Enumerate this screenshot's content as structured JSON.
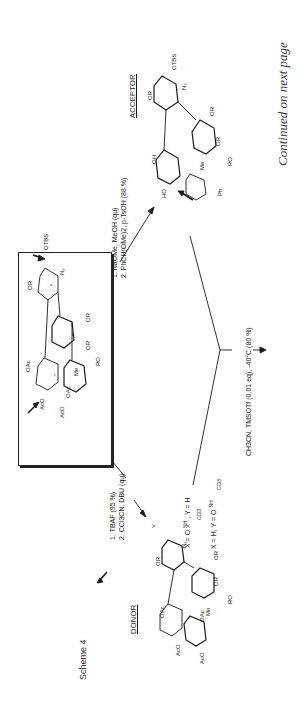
{
  "page": {
    "scheme_title": "Scheme 4",
    "continued_note": "Continued on next page"
  },
  "starting_material": {
    "substituents": [
      "OTBS",
      "N3",
      "OR",
      "OAc",
      "AcO",
      "AcO",
      "OAc",
      "Me",
      "OR",
      "OR",
      "RO"
    ],
    "ring_labels": [
      "a",
      "b",
      "c"
    ]
  },
  "acceptor": {
    "label": "ACCEPTOR",
    "substituents": [
      "OTBS",
      "N3",
      "OR",
      "OR",
      "OR",
      "RO",
      "OH",
      "HO",
      "Me",
      "Ph"
    ]
  },
  "donor": {
    "label": "DONOR",
    "substituents": [
      "Y",
      "X",
      "N3",
      "OR",
      "OAc",
      "AcO",
      "AcO",
      "OAc",
      "Me",
      "OR",
      "OR",
      "RO"
    ],
    "definitions": [
      {
        "x": "X = O–C(=NH)CCl3",
        "y": "Y = H"
      },
      {
        "x": "X = H",
        "y": "Y = O–C(=NH)CCl3"
      }
    ],
    "def1_text": "X = O",
    "def1_tail": ", Y = H",
    "def2_text": "X = H, Y = O",
    "nh": "NH",
    "ccl3": "CCl3"
  },
  "reactions": {
    "to_acceptor": {
      "step1": "1.  NaOMe, MeOH (qu)",
      "step2": "2.  PhCH(OMe)2, p-TsOH (88 %)"
    },
    "to_donor": {
      "step1": "1.  TBAF (95 %)",
      "step2": "2.  CCl3CN, DBU (qu)"
    },
    "coupling": {
      "conditions": "CH3CN, TMSOTf (0.01 eq), -40°C (80 %)"
    }
  }
}
